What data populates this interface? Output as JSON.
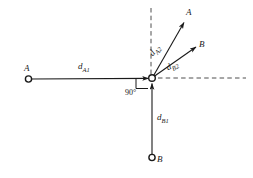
{
  "figure": {
    "background_color": "#ffffff",
    "line_color": "#1a1a1a",
    "dash_color": "#3a3a3a"
  },
  "nodes": {
    "vertex": {
      "x": 152,
      "y": 78,
      "label": ""
    },
    "a_left": {
      "x": 28,
      "y": 79,
      "label": "A"
    },
    "b_bottom": {
      "x": 152,
      "y": 158,
      "label": "B"
    },
    "a_upper_right": {
      "x": 189,
      "y": 13,
      "label": "A"
    },
    "b_right": {
      "x": 201,
      "y": 45,
      "label": "B"
    }
  },
  "segment_labels": {
    "d_a1": {
      "base": "d",
      "sub": "A1"
    },
    "d_a2": {
      "base": "d",
      "sub": "A2"
    },
    "d_b1": {
      "base": "d",
      "sub": "B1"
    },
    "d_b2": {
      "base": "d",
      "sub": "B2"
    }
  },
  "angle": {
    "value": "90",
    "unit": "°",
    "text": "90°"
  },
  "axes": {
    "vertical_dashed": {
      "x": 151,
      "y_top": 8,
      "y_bottom": 78
    },
    "horizontal_dashed": {
      "y": 78,
      "x_left": 152,
      "x_right": 246
    }
  }
}
